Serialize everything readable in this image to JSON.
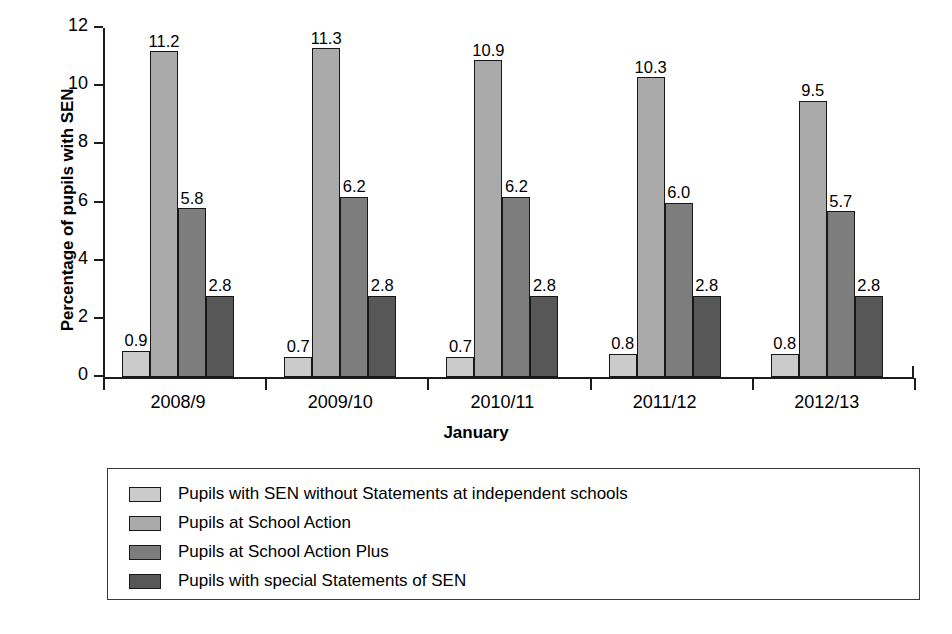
{
  "chart_data": {
    "type": "bar",
    "title": "",
    "xlabel": "January",
    "ylabel": "Percentage of pupils with SEN",
    "ylim": [
      0,
      12
    ],
    "yticks": [
      0,
      2,
      4,
      6,
      8,
      10,
      12
    ],
    "ytick_labels": [
      "0",
      "2",
      "4",
      "6",
      "8",
      "10",
      "12"
    ],
    "grid": false,
    "legend_position": "below-axes-boxed",
    "categories": [
      "2008/9",
      "2009/10",
      "2010/11",
      "2011/12",
      "2012/13"
    ],
    "series": [
      {
        "name": "Pupils with SEN without Statements at independent schools",
        "color": "#cbcbcb",
        "values": [
          0.9,
          0.7,
          0.7,
          0.8,
          0.8
        ],
        "labels": [
          "0.9",
          "0.7",
          "0.7",
          "0.8",
          "0.8"
        ]
      },
      {
        "name": "Pupils at School Action",
        "color": "#aaaaaa",
        "values": [
          11.2,
          11.3,
          10.9,
          10.3,
          9.5
        ],
        "labels": [
          "11.2",
          "11.3",
          "10.9",
          "10.3",
          "9.5"
        ]
      },
      {
        "name": "Pupils at School Action Plus",
        "color": "#7d7d7d",
        "values": [
          5.8,
          6.2,
          6.2,
          6.0,
          5.7
        ],
        "labels": [
          "5.8",
          "6.2",
          "6.2",
          "6.0",
          "5.7"
        ]
      },
      {
        "name": "Pupils with special Statements of SEN",
        "color": "#575757",
        "values": [
          2.8,
          2.8,
          2.8,
          2.8,
          2.8
        ],
        "labels": [
          "2.8",
          "2.8",
          "2.8",
          "2.8",
          "2.8"
        ]
      }
    ]
  },
  "axes": {
    "y_title": "Percentage of pupils with SEN",
    "x_title": "January"
  },
  "legend": {
    "items": [
      {
        "label": "Pupils with SEN without Statements at independent schools",
        "color": "#cbcbcb"
      },
      {
        "label": "Pupils at School Action",
        "color": "#aaaaaa"
      },
      {
        "label": "Pupils at School Action Plus",
        "color": "#7d7d7d"
      },
      {
        "label": "Pupils with special Statements of SEN",
        "color": "#575757"
      }
    ]
  }
}
